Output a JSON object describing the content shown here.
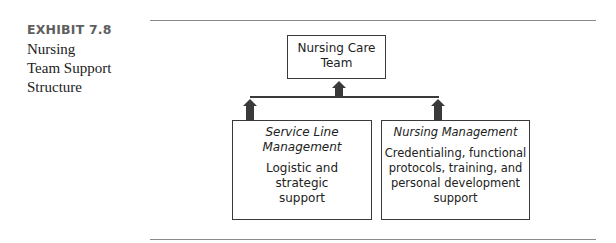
{
  "exhibit": {
    "label": "EXHIBIT 7.8",
    "title_lines": [
      "Nursing",
      "Team Support",
      "Structure"
    ]
  },
  "diagram": {
    "top_node": {
      "lines": [
        "Nursing Care",
        "Team"
      ]
    },
    "left_node": {
      "heading_lines": [
        "Service Line",
        "Management"
      ],
      "body_lines": [
        "Logistic and",
        "strategic",
        "support"
      ]
    },
    "right_node": {
      "heading_lines": [
        "Nursing Management"
      ],
      "body_lines": [
        "Credentialing, functional",
        "protocols, training, and",
        "personal development support"
      ]
    },
    "edges": [
      {
        "from": "left_node",
        "to": "top_node",
        "type": "arrow-up"
      },
      {
        "from": "right_node",
        "to": "top_node",
        "type": "arrow-up"
      }
    ]
  }
}
